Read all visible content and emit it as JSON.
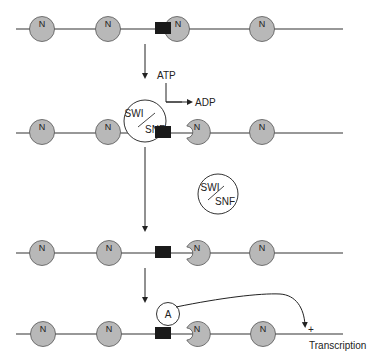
{
  "diagram": {
    "colors": {
      "nucleosome_fill": "#b8b8b8",
      "stroke": "#333333",
      "binding_site": "#1a1a1a",
      "background": "#ffffff"
    },
    "nucleosome_label": "N",
    "rows": [
      {
        "name": "initial-chromatin",
        "line_y": 29
      },
      {
        "name": "swi-snf-bound",
        "line_y": 133
      },
      {
        "name": "remodeled-chromatin",
        "line_y": 253
      },
      {
        "name": "activator-bound",
        "line_y": 334
      }
    ],
    "labels": {
      "atp": "ATP",
      "adp": "ADP",
      "swi": "SWI",
      "snf": "SNF",
      "activator": "A",
      "plus": "+",
      "transcription": "Transcription"
    }
  }
}
